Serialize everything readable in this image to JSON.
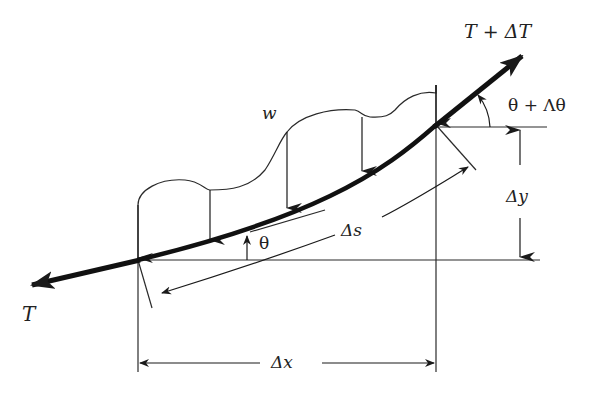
{
  "diagram": {
    "colors": {
      "ink": "#1a1a1a",
      "background": "#ffffff"
    },
    "labels": {
      "tension_left": "T",
      "tension_right": "T + ΔT",
      "load": "w",
      "angle_left": "θ",
      "angle_right": "θ + Λθ",
      "arc_length": "Δs",
      "dx": "Δx",
      "dy": "Δy"
    },
    "nodes": {
      "left": {
        "x": 138,
        "y": 260
      },
      "right": {
        "x": 436,
        "y": 125
      }
    },
    "load_arrows_x": [
      138,
      210,
      287,
      362,
      436
    ],
    "caption": ""
  }
}
